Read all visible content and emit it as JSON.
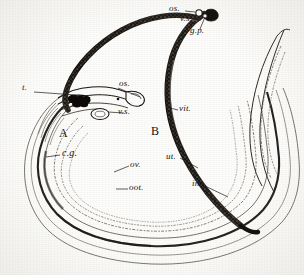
{
  "figure": {
    "type": "anatomical-illustration",
    "background_color": "#fdfdfb",
    "ink_color": "#14100d"
  },
  "specimens": [
    {
      "id": "A",
      "letter": "A",
      "description": "female worm, pale outlined body"
    },
    {
      "id": "B",
      "letter": "B",
      "description": "male worm, dark stippled body"
    }
  ],
  "labels": [
    {
      "key": "t",
      "text": "t.",
      "x": 26,
      "y": 88,
      "size": "lbl-sm",
      "target_x": 75,
      "target_y": 96
    },
    {
      "key": "os_a",
      "text": "os.",
      "x": 120,
      "y": 84,
      "size": "lbl-sm",
      "target_x": 106,
      "target_y": 97
    },
    {
      "key": "vs_a",
      "text": "v.s.",
      "x": 113,
      "y": 112,
      "size": "lbl-sm",
      "target_x": 99,
      "target_y": 108
    },
    {
      "key": "os_b",
      "text": "os.",
      "x": 172,
      "y": 6,
      "size": "lbl-sm",
      "target_x": 196,
      "target_y": 12
    },
    {
      "key": "vs_b",
      "text": "v.s.",
      "x": 180,
      "y": 17,
      "size": "lbl-sm",
      "target_x": 199,
      "target_y": 16
    },
    {
      "key": "gp",
      "text": "g.p.",
      "x": 190,
      "y": 31,
      "size": "lbl-sm",
      "target_x": 204,
      "target_y": 16
    },
    {
      "key": "vit",
      "text": "vit.",
      "x": 180,
      "y": 112,
      "size": "lbl-sm",
      "target_x": 172,
      "target_y": 106
    },
    {
      "key": "A",
      "text": "A",
      "x": 60,
      "y": 133,
      "size": "lbl-big",
      "target_x": null,
      "target_y": null
    },
    {
      "key": "B",
      "text": "B",
      "x": 152,
      "y": 131,
      "size": "lbl-big",
      "target_x": null,
      "target_y": null
    },
    {
      "key": "cg",
      "text": "c.g.",
      "x": 62,
      "y": 153,
      "size": "lbl-md",
      "target_x": 46,
      "target_y": 157
    },
    {
      "key": "ov",
      "text": "ov.",
      "x": 131,
      "y": 164,
      "size": "lbl-sm",
      "target_x": 116,
      "target_y": 170
    },
    {
      "key": "oot",
      "text": "oot.",
      "x": 130,
      "y": 187,
      "size": "lbl-sm",
      "target_x": 118,
      "target_y": 188
    },
    {
      "key": "ut",
      "text": "ut.",
      "x": 168,
      "y": 156,
      "size": "lbl-sm",
      "target_x": 196,
      "target_y": 167
    },
    {
      "key": "int",
      "text": "int.",
      "x": 193,
      "y": 183,
      "size": "lbl-sm",
      "target_x": 227,
      "target_y": 196
    }
  ],
  "legend_meaning": {
    "t": "testes",
    "os": "oral sucker",
    "vs": "ventral sucker",
    "gp": "genital pore",
    "vit": "vitellaria",
    "cg": "gynaecophoric canal",
    "ov": "ovary",
    "oot": "ootype",
    "ut": "uterus",
    "int": "intestine"
  }
}
